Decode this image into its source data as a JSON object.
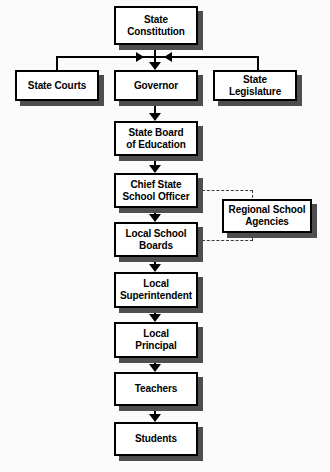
{
  "diagram": {
    "type": "org-chart",
    "background_color": "#fbfbfc",
    "box_fill_color": "#ffffff",
    "box_border_color": "#000000",
    "shadow_color": "#4e4e4e",
    "connector_color": "#000000",
    "dashed_connector_color": "#3a3a3a",
    "nodes": [
      {
        "id": "state-constitution",
        "label": "State\nConstitution",
        "level": 0
      },
      {
        "id": "state-courts",
        "label": "State Courts",
        "level": 1
      },
      {
        "id": "governor",
        "label": "Governor",
        "level": 1
      },
      {
        "id": "state-legislature",
        "label": "State\nLegislature",
        "level": 1
      },
      {
        "id": "state-board-education",
        "label": "State Board\nof Education",
        "level": 2
      },
      {
        "id": "chief-state-school-officer",
        "label": "Chief State\nSchool Officer",
        "level": 3
      },
      {
        "id": "regional-school-agencies",
        "label": "Regional School\nAgencies",
        "level": 3
      },
      {
        "id": "local-school-boards",
        "label": "Local School\nBoards",
        "level": 4
      },
      {
        "id": "local-superintendent",
        "label": "Local\nSuperintendent",
        "level": 5
      },
      {
        "id": "local-principal",
        "label": "Local\nPrincipal",
        "level": 6
      },
      {
        "id": "teachers",
        "label": "Teachers",
        "level": 7
      },
      {
        "id": "students",
        "label": "Students",
        "level": 8
      }
    ],
    "edges": [
      {
        "from": "state-constitution",
        "to": "state-courts",
        "style": "solid",
        "arrow": true
      },
      {
        "from": "state-constitution",
        "to": "governor",
        "style": "solid",
        "arrow": true
      },
      {
        "from": "state-constitution",
        "to": "state-legislature",
        "style": "solid",
        "arrow": true
      },
      {
        "from": "governor",
        "to": "state-board-education",
        "style": "solid",
        "arrow": true
      },
      {
        "from": "state-board-education",
        "to": "chief-state-school-officer",
        "style": "solid",
        "arrow": true
      },
      {
        "from": "chief-state-school-officer",
        "to": "local-school-boards",
        "style": "solid",
        "arrow": true
      },
      {
        "from": "chief-state-school-officer",
        "to": "regional-school-agencies",
        "style": "dashed",
        "arrow": false
      },
      {
        "from": "local-school-boards",
        "to": "regional-school-agencies",
        "style": "dashed",
        "arrow": false
      },
      {
        "from": "local-school-boards",
        "to": "local-superintendent",
        "style": "solid",
        "arrow": true
      },
      {
        "from": "local-superintendent",
        "to": "local-principal",
        "style": "solid",
        "arrow": true
      },
      {
        "from": "local-principal",
        "to": "teachers",
        "style": "solid",
        "arrow": true
      },
      {
        "from": "teachers",
        "to": "students",
        "style": "solid",
        "arrow": true
      }
    ]
  }
}
